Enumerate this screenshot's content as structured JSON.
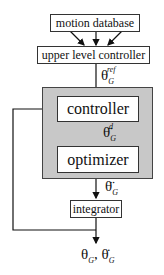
{
  "diagram": {
    "nodes": {
      "motion_database": "motion database",
      "upper_level_controller": "upper level controller",
      "controller": "controller",
      "optimizer": "optimizer",
      "integrator": "integrator"
    },
    "signals": {
      "theta_ref": {
        "base": "θ",
        "sub": "G",
        "sup": "ref"
      },
      "theta_ddot_d": {
        "base": "θ̈",
        "sub": "G",
        "sup": "d"
      },
      "theta_ddot": {
        "base": "θ̈",
        "sub": "G"
      },
      "output": {
        "a": "θ",
        "a_sub": "G",
        "sep": ",",
        "b": "θ̇",
        "b_sub": "G"
      }
    },
    "colors": {
      "group_fill": "#c8c8c8",
      "line": "#111111"
    }
  }
}
